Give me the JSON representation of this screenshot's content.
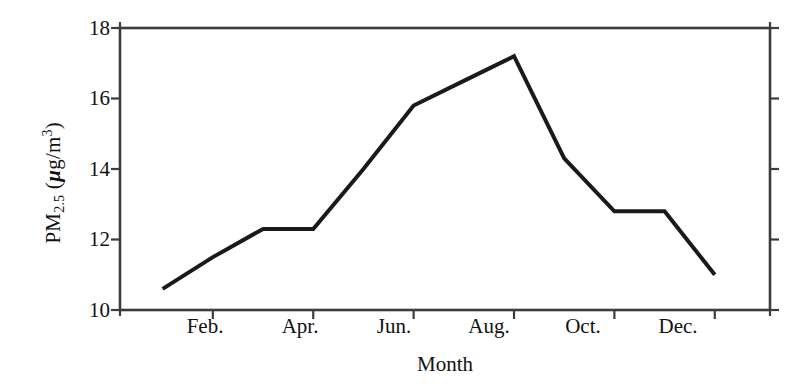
{
  "chart_data": {
    "type": "line",
    "title": "",
    "xlabel": "Month",
    "ylabel": "PM2.5 (µg/m3)",
    "ylabel_parts": {
      "prefix": "PM",
      "subscript": "2.5",
      "unit_open": " (",
      "unit_mu": "µ",
      "unit_mid": "g/m",
      "unit_sup": "3",
      "unit_close": ")"
    },
    "x": [
      "Jan.",
      "Feb.",
      "Mar.",
      "Apr.",
      "May",
      "Jun.",
      "Jul.",
      "Aug.",
      "Sep.",
      "Oct.",
      "Nov.",
      "Dec."
    ],
    "values": [
      10.6,
      11.5,
      12.3,
      12.3,
      14.0,
      15.8,
      16.5,
      17.2,
      14.3,
      12.8,
      12.8,
      11.0
    ],
    "series": [
      {
        "name": "PM2.5",
        "color": "#1a1a1a",
        "values": [
          10.6,
          11.5,
          12.3,
          12.3,
          14.0,
          15.8,
          16.5,
          17.2,
          14.3,
          12.8,
          12.8,
          11.0
        ]
      }
    ],
    "xlim": [
      0.15,
      13.1
    ],
    "ylim": [
      10,
      18
    ],
    "ytick_values": [
      10,
      12,
      14,
      16,
      18
    ],
    "ytick_labels": [
      "10",
      "12",
      "14",
      "16",
      "18"
    ],
    "xtick_positions": [
      2,
      4,
      6,
      8,
      10,
      12
    ],
    "xtick_labels": [
      "Feb.",
      "Apr.",
      "Jun.",
      "Aug.",
      "Oct.",
      "Dec."
    ],
    "grid": false,
    "legend": null,
    "frame": "box",
    "line_width_px": 4,
    "axis_color": "#3c3c3c"
  }
}
